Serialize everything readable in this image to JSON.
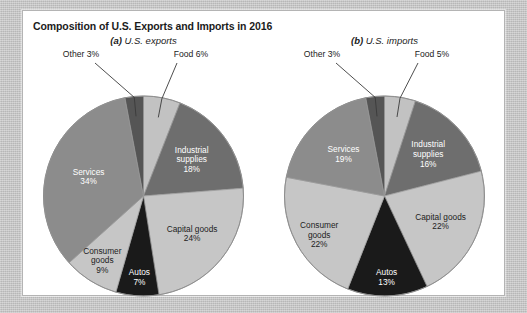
{
  "figure": {
    "title": "Composition of U.S. Exports and Imports in 2016",
    "background_color": "#c9c9c9",
    "panel_color": "#ffffff",
    "panel_border_color": "#b4b4b4"
  },
  "chart_data": [
    {
      "type": "pie",
      "id": "us-exports",
      "panel_letter": "(a)",
      "title": "U.S. exports",
      "subtitle_full": "(a) U.S. exports",
      "start_angle_deg": 0,
      "direction": "clockwise",
      "categories": [
        "Food",
        "Industrial supplies",
        "Capital goods",
        "Autos",
        "Consumer goods",
        "Services",
        "Other"
      ],
      "values": [
        6,
        18,
        24,
        7,
        9,
        34,
        3
      ],
      "labels": [
        {
          "name": "Food",
          "percent_text": "6%",
          "display": "Food 6%",
          "placement": "callout",
          "color": "#c2c2c2",
          "text_color": "#1d1d1d"
        },
        {
          "name": "Industrial supplies",
          "percent_text": "18%",
          "display": "Industrial supplies 18%",
          "placement": "inside",
          "color": "#6e6e6e",
          "text_color": "#ffffff"
        },
        {
          "name": "Capital goods",
          "percent_text": "24%",
          "display": "Capital goods 24%",
          "placement": "inside",
          "color": "#c6c6c6",
          "text_color": "#1d1d1d"
        },
        {
          "name": "Autos",
          "percent_text": "7%",
          "display": "Autos 7%",
          "placement": "inside",
          "color": "#1a1a1a",
          "text_color": "#ffffff"
        },
        {
          "name": "Consumer goods",
          "percent_text": "9%",
          "display": "Consumer goods 9%",
          "placement": "inside",
          "color": "#c6c6c6",
          "text_color": "#1d1d1d"
        },
        {
          "name": "Services",
          "percent_text": "34%",
          "display": "Services 34%",
          "placement": "inside",
          "color": "#8c8c8c",
          "text_color": "#ffffff"
        },
        {
          "name": "Other",
          "percent_text": "3%",
          "display": "Other 3%",
          "placement": "callout",
          "color": "#555555",
          "text_color": "#1d1d1d"
        }
      ]
    },
    {
      "type": "pie",
      "id": "us-imports",
      "panel_letter": "(b)",
      "title": "U.S. imports",
      "subtitle_full": "(b) U.S. imports",
      "start_angle_deg": 0,
      "direction": "clockwise",
      "categories": [
        "Food",
        "Industrial supplies",
        "Capital goods",
        "Autos",
        "Consumer goods",
        "Services",
        "Other"
      ],
      "values": [
        5,
        16,
        22,
        13,
        22,
        19,
        3
      ],
      "labels": [
        {
          "name": "Food",
          "percent_text": "5%",
          "display": "Food 5%",
          "placement": "callout",
          "color": "#c2c2c2",
          "text_color": "#1d1d1d"
        },
        {
          "name": "Industrial supplies",
          "percent_text": "16%",
          "display": "Industrial supplies 16%",
          "placement": "inside",
          "color": "#6e6e6e",
          "text_color": "#ffffff"
        },
        {
          "name": "Capital goods",
          "percent_text": "22%",
          "display": "Capital goods 22%",
          "placement": "inside",
          "color": "#c6c6c6",
          "text_color": "#1d1d1d"
        },
        {
          "name": "Autos",
          "percent_text": "13%",
          "display": "Autos 13%",
          "placement": "inside",
          "color": "#1a1a1a",
          "text_color": "#ffffff"
        },
        {
          "name": "Consumer goods",
          "percent_text": "22%",
          "display": "Consumer goods 22%",
          "placement": "inside",
          "color": "#c6c6c6",
          "text_color": "#1d1d1d"
        },
        {
          "name": "Services",
          "percent_text": "19%",
          "display": "Services 19%",
          "placement": "inside",
          "color": "#8c8c8c",
          "text_color": "#ffffff"
        },
        {
          "name": "Other",
          "percent_text": "3%",
          "display": "Other 3%",
          "placement": "callout",
          "color": "#555555",
          "text_color": "#1d1d1d"
        }
      ]
    }
  ]
}
